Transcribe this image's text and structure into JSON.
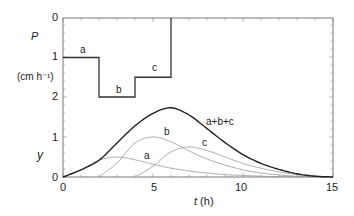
{
  "chart_data": [
    {
      "type": "line",
      "title": "Precipitation hyetograph",
      "ylabel": "P",
      "ylabel_units": "(cm h⁻¹)",
      "y_inverted": true,
      "ylim": [
        0,
        2
      ],
      "yticks": [
        "0",
        "1",
        "2"
      ],
      "xlim": [
        0,
        15
      ],
      "series": [
        {
          "name": "a",
          "x": [
            0,
            2
          ],
          "values": [
            1,
            1
          ]
        },
        {
          "name": "b",
          "x": [
            2,
            4
          ],
          "values": [
            2,
            2
          ]
        },
        {
          "name": "c",
          "x": [
            4,
            6
          ],
          "values": [
            1.5,
            1.5
          ]
        }
      ],
      "step_path": {
        "x": [
          0,
          2,
          2,
          4,
          4,
          6,
          6
        ],
        "y": [
          1,
          1,
          2,
          2,
          1.5,
          1.5,
          0
        ]
      }
    },
    {
      "type": "line",
      "xlabel": "t (h)",
      "ylabel": "y",
      "xlim": [
        0,
        15
      ],
      "ylim": [
        0,
        2
      ],
      "xticks": [
        "0",
        "5",
        "10",
        "15"
      ],
      "yticks": [
        "0",
        "1"
      ],
      "series": [
        {
          "name": "a",
          "x": [
            0,
            1,
            2,
            3,
            4,
            5,
            6,
            7,
            8,
            9,
            10,
            11,
            12
          ],
          "values": [
            0,
            0.18,
            0.42,
            0.5,
            0.43,
            0.32,
            0.22,
            0.15,
            0.1,
            0.06,
            0.04,
            0.02,
            0.01
          ]
        },
        {
          "name": "b",
          "x": [
            2,
            3,
            4,
            5,
            6,
            7,
            8,
            9,
            10,
            11,
            12,
            13
          ],
          "values": [
            0,
            0.35,
            0.85,
            1.0,
            0.88,
            0.65,
            0.45,
            0.3,
            0.18,
            0.1,
            0.05,
            0.02
          ]
        },
        {
          "name": "c",
          "x": [
            4,
            5,
            6,
            7,
            8,
            9,
            10,
            11,
            12,
            13,
            14
          ],
          "values": [
            0,
            0.27,
            0.63,
            0.75,
            0.66,
            0.5,
            0.34,
            0.22,
            0.13,
            0.06,
            0.02
          ]
        },
        {
          "name": "a+b+c",
          "x": [
            0,
            1,
            2,
            3,
            4,
            5,
            6,
            7,
            8,
            9,
            10,
            11,
            12,
            13,
            14,
            15
          ],
          "values": [
            0,
            0.18,
            0.42,
            0.85,
            1.28,
            1.59,
            1.73,
            1.55,
            1.21,
            0.86,
            0.56,
            0.34,
            0.19,
            0.08,
            0.02,
            0
          ]
        }
      ],
      "annotations": [
        "a",
        "b",
        "c",
        "a+b+c"
      ]
    }
  ],
  "labels": {
    "p_axis": "P",
    "p_units": "(cm h⁻¹)",
    "p_tick0": "0",
    "p_tick1": "1",
    "p_tick2": "2",
    "y_axis": "y",
    "y_tick0": "0",
    "y_tick1": "1",
    "x_tick0": "0",
    "x_tick5": "5",
    "x_tick10": "10",
    "x_tick15": "15",
    "x_axis": "t (h)",
    "step_a": "a",
    "step_b": "b",
    "step_c": "c",
    "curve_a": "a",
    "curve_b": "b",
    "curve_c": "c",
    "curve_sum": "a+b+c"
  }
}
